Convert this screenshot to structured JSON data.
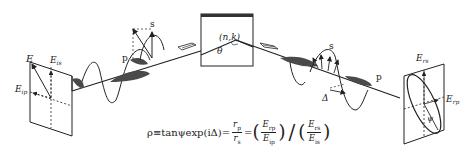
{
  "diagram": {
    "type": "ellipsometry-principle",
    "incident_plane": {
      "labels": {
        "E": "E",
        "E_is": "E",
        "E_is_sub": "is",
        "E_ip": "E",
        "E_ip_sub": "ip"
      }
    },
    "incident_wave": {
      "s_label": "s",
      "p_label": "p"
    },
    "sample": {
      "label": "(n,k)",
      "angle_label": "θ"
    },
    "reflected_wave": {
      "s_label": "s",
      "p_label": "p",
      "delta_label": "Δ"
    },
    "reflected_plane": {
      "labels": {
        "E_rs": "E",
        "E_rs_sub": "rs",
        "E_rp": "E",
        "E_rp_sub": "rp",
        "psi": "ψ"
      }
    },
    "formula": {
      "lhs": "ρ≡tanψexp(iΔ)=",
      "frac1_num": "r",
      "frac1_num_sub": "p",
      "frac1_den": "r",
      "frac1_den_sub": "s",
      "eq": "=",
      "frac2_num": "E",
      "frac2_num_sub": "rp",
      "frac2_den": "E",
      "frac2_den_sub": "ip",
      "frac3_num": "E",
      "frac3_num_sub": "rs",
      "frac3_den": "E",
      "frac3_den_sub": "is"
    },
    "colors": {
      "line": "#222222",
      "shade": "#4a4a4a",
      "sample_top": "#333333"
    }
  }
}
